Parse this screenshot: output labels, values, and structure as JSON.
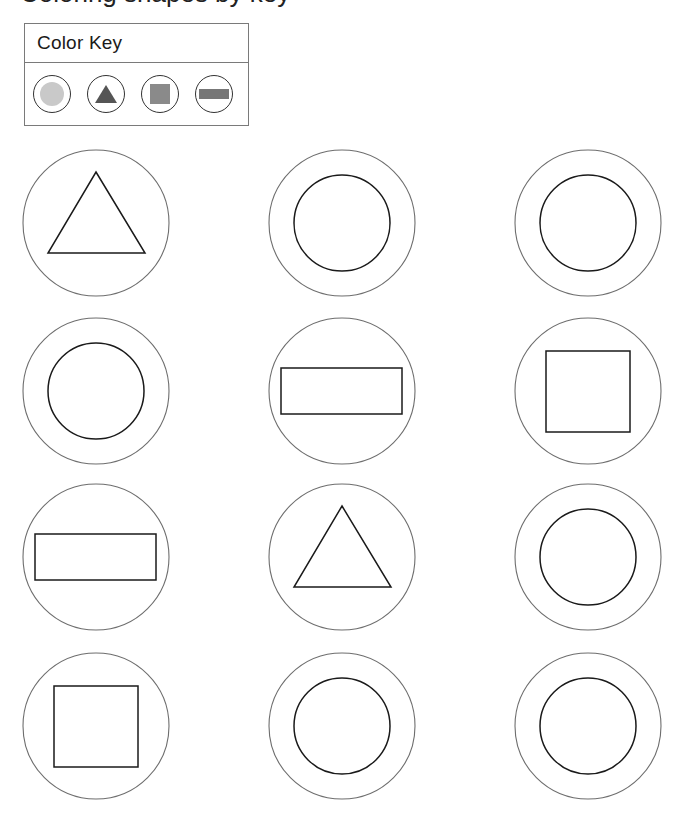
{
  "page": {
    "cropped_heading": "Coloring shapes by key"
  },
  "color_key": {
    "title": "Color Key",
    "items": [
      {
        "shape": "circle",
        "fill": "#c9c9c9",
        "label": "circle-light-gray"
      },
      {
        "shape": "triangle",
        "fill": "#555555",
        "label": "triangle-dark-gray"
      },
      {
        "shape": "square",
        "fill": "#8a8a8a",
        "label": "square-medium-gray"
      },
      {
        "shape": "rectangle",
        "fill": "#777777",
        "label": "rectangle-gray"
      }
    ]
  },
  "colors": {
    "outer_stroke": "#6e6e6e",
    "inner_stroke": "#1a1a1a",
    "key_border": "#7a7a7a"
  },
  "grid": {
    "columns": 3,
    "rows": 4,
    "cells": [
      {
        "row": 1,
        "col": 1,
        "shape": "triangle",
        "filled": false
      },
      {
        "row": 1,
        "col": 2,
        "shape": "circle",
        "filled": false
      },
      {
        "row": 1,
        "col": 3,
        "shape": "circle",
        "filled": false
      },
      {
        "row": 2,
        "col": 1,
        "shape": "circle",
        "filled": false
      },
      {
        "row": 2,
        "col": 2,
        "shape": "rectangle",
        "filled": false
      },
      {
        "row": 2,
        "col": 3,
        "shape": "square",
        "filled": false
      },
      {
        "row": 3,
        "col": 1,
        "shape": "rectangle",
        "filled": false
      },
      {
        "row": 3,
        "col": 2,
        "shape": "triangle",
        "filled": false
      },
      {
        "row": 3,
        "col": 3,
        "shape": "circle",
        "filled": false
      },
      {
        "row": 4,
        "col": 1,
        "shape": "square",
        "filled": false
      },
      {
        "row": 4,
        "col": 2,
        "shape": "circle",
        "filled": false
      },
      {
        "row": 4,
        "col": 3,
        "shape": "circle",
        "filled": false
      }
    ]
  }
}
